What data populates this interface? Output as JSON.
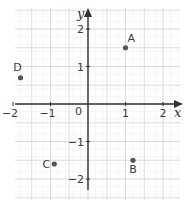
{
  "chart_data": {
    "type": "scatter",
    "title": "",
    "xlabel": "x",
    "ylabel": "y",
    "xlim": [
      -2,
      2.3
    ],
    "ylim": [
      -2.2,
      2.4
    ],
    "grid": true,
    "minor_grid": true,
    "x_ticks": [
      {
        "value": -2,
        "label": "−2"
      },
      {
        "value": -1,
        "label": "−1"
      },
      {
        "value": 1,
        "label": "1"
      },
      {
        "value": 2,
        "label": "2"
      }
    ],
    "y_ticks": [
      {
        "value": 2,
        "label": "2"
      },
      {
        "value": 1,
        "label": "1"
      },
      {
        "value": -1,
        "label": "−1"
      },
      {
        "value": -2,
        "label": "−2"
      }
    ],
    "origin_label": "0",
    "points": [
      {
        "label": "A",
        "x": 1.0,
        "y": 1.5
      },
      {
        "label": "B",
        "x": 1.2,
        "y": -1.5
      },
      {
        "label": "C",
        "x": -0.9,
        "y": -1.6
      },
      {
        "label": "D",
        "x": -1.8,
        "y": 0.7
      }
    ],
    "colors": {
      "point": "#555555",
      "axis": "#333333",
      "major_grid": "#d4d4d4",
      "minor_grid": "#ececec"
    }
  }
}
